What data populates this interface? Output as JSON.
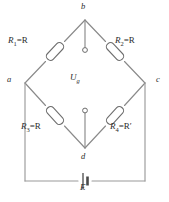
{
  "figure": {
    "type": "wheatstone-bridge-circuit-diagram",
    "background_color": "#ffffff",
    "wire_color": "#8a8a8a",
    "label_color": "#2b2b2b"
  },
  "nodes": {
    "top": "b",
    "left": "a",
    "right": "c",
    "bottom": "d"
  },
  "components": {
    "r1": {
      "name": "R1",
      "label_prefix": "R",
      "subscript": "1",
      "equals": "=",
      "value": "R"
    },
    "r2": {
      "name": "R2",
      "label_prefix": "R",
      "subscript": "2",
      "equals": "=",
      "value": "R"
    },
    "r3": {
      "name": "R3",
      "label_prefix": "R",
      "subscript": "3",
      "equals": "=",
      "value": "R"
    },
    "r4": {
      "name": "R4",
      "label_prefix": "R",
      "subscript": "4",
      "equals": "=",
      "value": "R′"
    },
    "galvanometer": {
      "label_prefix": "U",
      "subscript": "g"
    },
    "source": {
      "label": "E"
    }
  },
  "labels": {
    "node_b": "b",
    "node_a": "a",
    "node_c": "c",
    "node_d": "d",
    "r1_text": "R",
    "r1_sub": "1",
    "r1_rhs": "=R",
    "r2_text": "R",
    "r2_sub": "2",
    "r2_rhs": "=R",
    "r3_text": "R",
    "r3_sub": "3",
    "r3_rhs": "=R",
    "r4_text": "R",
    "r4_sub": "4",
    "r4_rhs": "=R′",
    "ug_text": "U",
    "ug_sub": "g",
    "emf": "E"
  }
}
